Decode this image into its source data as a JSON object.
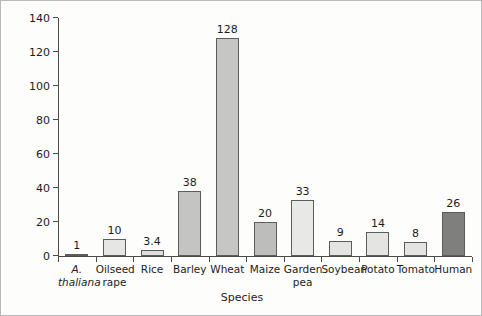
{
  "chart_data": {
    "type": "bar",
    "title": "",
    "xlabel": "Species",
    "ylabel": "Relative genome size",
    "ylim": [
      0,
      140
    ],
    "ytick_values": [
      0,
      20,
      40,
      60,
      80,
      100,
      120,
      140
    ],
    "ytick_labels": [
      "0",
      "20",
      "40",
      "60",
      "80",
      "100",
      "120",
      "140"
    ],
    "grid": false,
    "legend": "none",
    "categories": [
      "A. thaliana",
      "Oilseed rape",
      "Rice",
      "Barley",
      "Wheat",
      "Maize",
      "Garden pea",
      "Soybean",
      "Potato",
      "Tomato",
      "Human"
    ],
    "values": [
      1,
      10,
      3.4,
      38,
      128,
      20,
      33,
      9,
      14,
      8,
      26
    ],
    "data_labels": [
      "1",
      "10",
      "3.4",
      "38",
      "128",
      "20",
      "33",
      "9",
      "14",
      "8",
      "26"
    ],
    "bars": [
      {
        "label_line1": "A.",
        "label_line2": "thaliana",
        "italic": true,
        "value": 1,
        "data_label": "1",
        "fill": "#e6e6e4"
      },
      {
        "label_line1": "Oilseed",
        "label_line2": "rape",
        "italic": false,
        "value": 10,
        "data_label": "10",
        "fill": "#e6e6e4"
      },
      {
        "label_line1": "Rice",
        "label_line2": "",
        "italic": false,
        "value": 3.4,
        "data_label": "3.4",
        "fill": "#dedede"
      },
      {
        "label_line1": "Barley",
        "label_line2": "",
        "italic": false,
        "value": 38,
        "data_label": "38",
        "fill": "#c4c4c2"
      },
      {
        "label_line1": "Wheat",
        "label_line2": "",
        "italic": false,
        "value": 128,
        "data_label": "128",
        "fill": "#c6c6c4"
      },
      {
        "label_line1": "Maize",
        "label_line2": "",
        "italic": false,
        "value": 20,
        "data_label": "20",
        "fill": "#bdbdbb"
      },
      {
        "label_line1": "Garden",
        "label_line2": "pea",
        "italic": false,
        "value": 33,
        "data_label": "33",
        "fill": "#e8e8e6"
      },
      {
        "label_line1": "Soybean",
        "label_line2": "",
        "italic": false,
        "value": 9,
        "data_label": "9",
        "fill": "#e4e4e2"
      },
      {
        "label_line1": "Potato",
        "label_line2": "",
        "italic": false,
        "value": 14,
        "data_label": "14",
        "fill": "#e4e4e2"
      },
      {
        "label_line1": "Tomato",
        "label_line2": "",
        "italic": false,
        "value": 8,
        "data_label": "8",
        "fill": "#e4e4e2"
      },
      {
        "label_line1": "Human",
        "label_line2": "",
        "italic": false,
        "value": 26,
        "data_label": "26",
        "fill": "#7f7f7d"
      }
    ],
    "colors": {
      "axis": "#4a4a4a",
      "bar_outline": "#5c5c5c",
      "text": "#1c1c1c",
      "background": "#fdfdfc",
      "fill_light": "#e6e6e4",
      "fill_medium": "#c4c4c2",
      "fill_dark": "#7f7f7d"
    }
  }
}
